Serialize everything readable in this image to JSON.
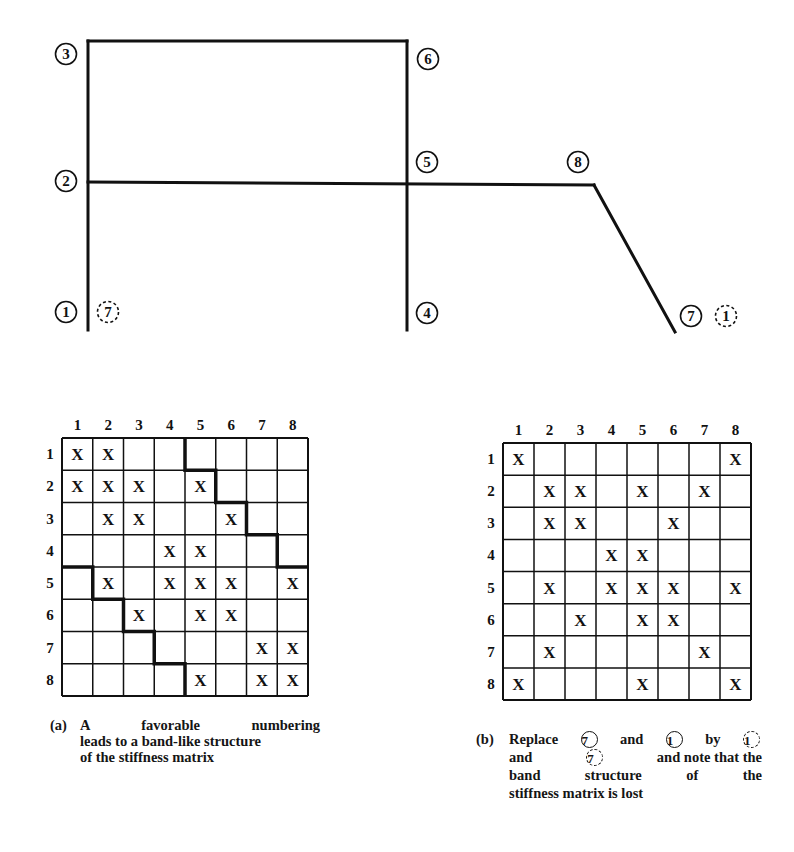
{
  "frame": {
    "nodes": [
      {
        "id": "1",
        "label": "1",
        "cx": 66,
        "cy": 312,
        "style": "solid"
      },
      {
        "id": "2",
        "label": "2",
        "cx": 66,
        "cy": 181,
        "style": "solid"
      },
      {
        "id": "3",
        "label": "3",
        "cx": 66,
        "cy": 54,
        "style": "solid"
      },
      {
        "id": "4",
        "label": "4",
        "cx": 427,
        "cy": 313,
        "style": "solid"
      },
      {
        "id": "5",
        "label": "5",
        "cx": 427,
        "cy": 162,
        "style": "solid"
      },
      {
        "id": "6",
        "label": "6",
        "cx": 428,
        "cy": 59,
        "style": "solid"
      },
      {
        "id": "7",
        "label": "7",
        "cx": 691,
        "cy": 316,
        "style": "solid"
      },
      {
        "id": "8",
        "label": "8",
        "cx": 578,
        "cy": 162,
        "style": "solid"
      },
      {
        "id": "alt-7",
        "label": "7",
        "cx": 108,
        "cy": 312,
        "style": "dashed"
      },
      {
        "id": "alt-1",
        "label": "1",
        "cx": 726,
        "cy": 316,
        "style": "dashed"
      }
    ],
    "members": [
      {
        "from": [
          88,
          330
        ],
        "to": [
          88,
          41
        ]
      },
      {
        "from": [
          88,
          41
        ],
        "to": [
          407,
          41
        ]
      },
      {
        "from": [
          407,
          41
        ],
        "to": [
          407,
          330
        ]
      },
      {
        "from": [
          88,
          182
        ],
        "to": [
          594,
          185
        ]
      },
      {
        "from": [
          594,
          185
        ],
        "to": [
          675,
          332
        ]
      }
    ]
  },
  "matrix_a": {
    "id": "a",
    "x": 62,
    "y": 438,
    "w": 246,
    "h": 258,
    "col_labels": [
      "1",
      "2",
      "3",
      "4",
      "5",
      "6",
      "7",
      "8"
    ],
    "row_labels": [
      "1",
      "2",
      "3",
      "4",
      "5",
      "6",
      "7",
      "8"
    ],
    "entries": [
      [
        1,
        2
      ],
      [
        1,
        2,
        3,
        5
      ],
      [
        2,
        3,
        6
      ],
      [
        4,
        5
      ],
      [
        2,
        4,
        5,
        6,
        8
      ],
      [
        3,
        5,
        6
      ],
      [
        7,
        8
      ],
      [
        5,
        7,
        8
      ]
    ],
    "mark": "X",
    "band_upper": [
      [
        4,
        0
      ],
      [
        4,
        1
      ],
      [
        5,
        1
      ],
      [
        5,
        2
      ],
      [
        6,
        2
      ],
      [
        6,
        3
      ],
      [
        7,
        3
      ],
      [
        7,
        4
      ],
      [
        8,
        4
      ]
    ],
    "band_lower": [
      [
        0,
        4
      ],
      [
        1,
        4
      ],
      [
        1,
        5
      ],
      [
        2,
        5
      ],
      [
        2,
        6
      ],
      [
        3,
        6
      ],
      [
        3,
        7
      ],
      [
        4,
        7
      ],
      [
        4,
        8
      ]
    ]
  },
  "matrix_b": {
    "id": "b",
    "x": 503,
    "y": 443,
    "w": 248,
    "h": 257,
    "col_labels": [
      "1",
      "2",
      "3",
      "4",
      "5",
      "6",
      "7",
      "8"
    ],
    "row_labels": [
      "1",
      "2",
      "3",
      "4",
      "5",
      "6",
      "7",
      "8"
    ],
    "entries": [
      [
        1,
        8
      ],
      [
        2,
        3,
        5,
        7
      ],
      [
        2,
        3,
        6
      ],
      [
        4,
        5
      ],
      [
        2,
        4,
        5,
        6,
        8
      ],
      [
        3,
        5,
        6
      ],
      [
        2,
        7
      ],
      [
        1,
        5,
        8
      ]
    ],
    "mark": "X"
  },
  "captions": {
    "a": {
      "tag": "(a)",
      "lines": [
        "A favorable numbering",
        "leads to a band-like structure",
        "of the stiffness matrix"
      ]
    },
    "b": {
      "tag": "(b)",
      "w1": "Replace",
      "n1": "7",
      "w2": "and",
      "n2": "1",
      "w3": "by",
      "n3": "1",
      "w4": "and",
      "n4": "7",
      "w5": "and note that the",
      "line3": "band structure of the",
      "line4": "stiffness matrix is lost"
    }
  },
  "colors": {
    "ink": "#111111",
    "background": "#ffffff"
  }
}
